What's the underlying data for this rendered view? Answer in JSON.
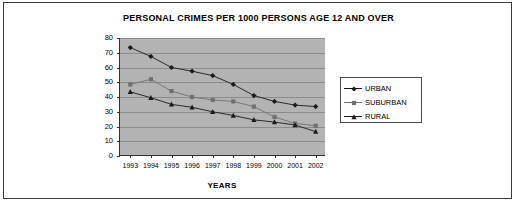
{
  "chart_data": {
    "type": "line",
    "title": "PERSONAL CRIMES PER 1000 PERSONS AGE 12 AND OVER",
    "xlabel": "YEARS",
    "ylabel": "",
    "categories": [
      "1993",
      "1994",
      "1995",
      "1996",
      "1997",
      "1998",
      "1999",
      "2000",
      "2001",
      "2002"
    ],
    "yticks": [
      "80",
      "70",
      "60",
      "50",
      "40",
      "30",
      "20",
      "10",
      "0"
    ],
    "ylim": [
      0,
      80
    ],
    "grid": true,
    "legend_position": "right",
    "series": [
      {
        "name": "URBAN",
        "marker": "diamond",
        "color": "#1a1a1a",
        "values": [
          73.5,
          67.5,
          60.0,
          57.5,
          54.5,
          48.5,
          41.0,
          37.0,
          34.5,
          33.5
        ]
      },
      {
        "name": "SUBURBAN",
        "marker": "square",
        "color": "#707070",
        "values": [
          48.5,
          52.0,
          44.0,
          40.0,
          38.0,
          37.0,
          33.5,
          26.5,
          22.0,
          20.5
        ]
      },
      {
        "name": "RURAL",
        "marker": "triangle",
        "color": "#1a1a1a",
        "values": [
          43.5,
          39.5,
          35.0,
          33.0,
          30.0,
          27.5,
          24.5,
          23.0,
          21.0,
          16.5
        ]
      }
    ]
  }
}
